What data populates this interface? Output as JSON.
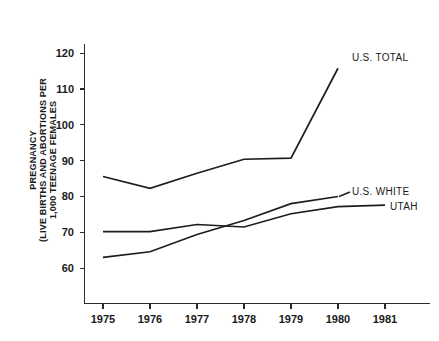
{
  "chart_data": {
    "type": "line",
    "title": "",
    "subtitle": "",
    "xlabel": "",
    "ylabel_lines": [
      "PREGNANCY",
      "(LIVE BIRTHS AND ABORTIONS PER",
      "1,000 TEENAGE FEMALES"
    ],
    "ylabel": "PREGNANCY (LIVE BIRTHS AND ABORTIONS PER 1,000 TEENAGE FEMALES)",
    "x": [
      1975,
      1976,
      1977,
      1978,
      1979,
      1980,
      1981
    ],
    "categories": [
      "1975",
      "1976",
      "1977",
      "1978",
      "1979",
      "1980",
      "1981"
    ],
    "xtick_labels": [
      "1975",
      "1976",
      "1977",
      "1978",
      "1979",
      "1980",
      "1981"
    ],
    "ytick_labels": [
      "120",
      "110",
      "100",
      "90",
      "80",
      "70",
      "60"
    ],
    "yticks": [
      120,
      110,
      100,
      90,
      80,
      70,
      60
    ],
    "xlim": [
      1974.6,
      1981.4
    ],
    "ylim": [
      55,
      124
    ],
    "grid": false,
    "legend_position": "right-inline-labels",
    "series": [
      {
        "name": "U.S. TOTAL",
        "label": "U.S. TOTAL",
        "x": [
          1975,
          1976,
          1977,
          1978,
          1979,
          1980
        ],
        "values": [
          85.6,
          82.3,
          86.5,
          90.4,
          90.7,
          115.8
        ]
      },
      {
        "name": "U.S. WHITE",
        "label": "U.S. WHITE",
        "x": [
          1975,
          1976,
          1977,
          1978,
          1979,
          1980
        ],
        "values": [
          63.0,
          64.6,
          69.4,
          73.3,
          78.0,
          80.0
        ]
      },
      {
        "name": "UTAH",
        "label": "UTAH",
        "x": [
          1975,
          1976,
          1977,
          1978,
          1979,
          1980,
          1981
        ],
        "values": [
          70.2,
          70.2,
          72.2,
          71.5,
          75.2,
          77.2,
          77.6
        ]
      }
    ],
    "annotations": [
      {
        "text": "U.S. TOTAL",
        "x": 1980,
        "y": 115.8
      },
      {
        "text": "U.S. WHITE",
        "x": 1980,
        "y": 80.0
      },
      {
        "text": "UTAH",
        "x": 1981,
        "y": 77.6
      }
    ],
    "colors": {
      "line": "#1d1d1d",
      "axis": "#2b2b2b",
      "text": "#1a1a1a",
      "background": "#ffffff"
    }
  }
}
